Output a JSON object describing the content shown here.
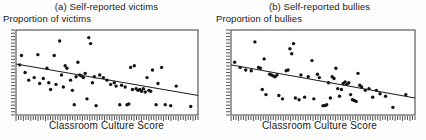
{
  "figure": {
    "kind": "two-panel-scatterplot",
    "background_color": "#fdfdfd",
    "ink_color": "#1a1a1a"
  },
  "panels": [
    {
      "title": "(a) Self-reported victims",
      "ylabel": "Proportion of victims",
      "xlabel": "Classroom Culture Score"
    },
    {
      "title": "(b) Self-reported bullies",
      "ylabel": "Proportion of bullies",
      "xlabel": "Classroom Culture Score"
    }
  ],
  "chart_data": [
    {
      "type": "scatter",
      "title": "(a) Self-reported victims",
      "xlabel": "Classroom Culture Score",
      "ylabel": "Proportion of victims",
      "xlim": [
        0,
        1
      ],
      "ylim": [
        0,
        1
      ],
      "grid": false,
      "legend": "none",
      "axis_ticks": "rug-style dense tick marks on bottom and left axes; no numeric tick labels",
      "trendline": {
        "type": "linear-fit",
        "description": "negative slope regression line",
        "x_start": 0.0,
        "y_start": 0.6,
        "x_end": 1.0,
        "y_end": 0.23
      },
      "points": [
        [
          0.02,
          0.59
        ],
        [
          0.03,
          0.7
        ],
        [
          0.05,
          0.5
        ],
        [
          0.07,
          0.41
        ],
        [
          0.1,
          0.44
        ],
        [
          0.12,
          0.71
        ],
        [
          0.13,
          0.37
        ],
        [
          0.15,
          0.43
        ],
        [
          0.17,
          0.55
        ],
        [
          0.18,
          0.38
        ],
        [
          0.19,
          0.3
        ],
        [
          0.21,
          0.7
        ],
        [
          0.22,
          0.36
        ],
        [
          0.24,
          0.87
        ],
        [
          0.25,
          0.47
        ],
        [
          0.26,
          0.33
        ],
        [
          0.27,
          0.58
        ],
        [
          0.28,
          0.55
        ],
        [
          0.3,
          0.41
        ],
        [
          0.31,
          0.29
        ],
        [
          0.32,
          0.12
        ],
        [
          0.33,
          0.45
        ],
        [
          0.34,
          0.62
        ],
        [
          0.35,
          0.47
        ],
        [
          0.36,
          0.46
        ],
        [
          0.37,
          0.44
        ],
        [
          0.38,
          0.49
        ],
        [
          0.39,
          0.19
        ],
        [
          0.4,
          0.91
        ],
        [
          0.41,
          0.84
        ],
        [
          0.42,
          0.38
        ],
        [
          0.43,
          0.45
        ],
        [
          0.44,
          0.11
        ],
        [
          0.46,
          0.47
        ],
        [
          0.48,
          0.44
        ],
        [
          0.5,
          0.41
        ],
        [
          0.52,
          0.36
        ],
        [
          0.54,
          0.38
        ],
        [
          0.55,
          0.34
        ],
        [
          0.57,
          0.12
        ],
        [
          0.58,
          0.35
        ],
        [
          0.6,
          0.33
        ],
        [
          0.61,
          0.12
        ],
        [
          0.62,
          0.13
        ],
        [
          0.63,
          0.56
        ],
        [
          0.64,
          0.3
        ],
        [
          0.65,
          0.58
        ],
        [
          0.66,
          0.31
        ],
        [
          0.67,
          0.29
        ],
        [
          0.68,
          0.3
        ],
        [
          0.69,
          0.28
        ],
        [
          0.7,
          0.31
        ],
        [
          0.71,
          0.27
        ],
        [
          0.72,
          0.44
        ],
        [
          0.73,
          0.29
        ],
        [
          0.74,
          0.28
        ],
        [
          0.75,
          0.53
        ],
        [
          0.77,
          0.12
        ],
        [
          0.78,
          0.37
        ],
        [
          0.8,
          0.56
        ],
        [
          0.82,
          0.12
        ],
        [
          0.85,
          0.11
        ],
        [
          0.88,
          0.34
        ],
        [
          0.96,
          0.1
        ]
      ]
    },
    {
      "type": "scatter",
      "title": "(b) Self-reported bullies",
      "xlabel": "Classroom Culture Score",
      "ylabel": "Proportion of bullies",
      "xlim": [
        0,
        1
      ],
      "ylim": [
        0,
        1
      ],
      "grid": false,
      "legend": "none",
      "axis_ticks": "rug-style dense tick marks on bottom and left axes; no numeric tick labels",
      "trendline": {
        "type": "linear-fit",
        "description": "negative slope regression line",
        "x_start": 0.0,
        "y_start": 0.59,
        "x_end": 1.0,
        "y_end": 0.2
      },
      "points": [
        [
          0.02,
          0.62
        ],
        [
          0.05,
          0.56
        ],
        [
          0.08,
          0.53
        ],
        [
          0.11,
          0.52
        ],
        [
          0.13,
          0.86
        ],
        [
          0.15,
          0.56
        ],
        [
          0.16,
          0.55
        ],
        [
          0.17,
          0.3
        ],
        [
          0.18,
          0.66
        ],
        [
          0.19,
          0.24
        ],
        [
          0.21,
          0.48
        ],
        [
          0.22,
          0.47
        ],
        [
          0.23,
          0.46
        ],
        [
          0.24,
          0.45
        ],
        [
          0.25,
          0.47
        ],
        [
          0.26,
          0.23
        ],
        [
          0.28,
          0.19
        ],
        [
          0.3,
          0.52
        ],
        [
          0.31,
          0.53
        ],
        [
          0.32,
          0.78
        ],
        [
          0.33,
          0.72
        ],
        [
          0.34,
          0.84
        ],
        [
          0.35,
          0.2
        ],
        [
          0.37,
          0.18
        ],
        [
          0.38,
          0.47
        ],
        [
          0.4,
          0.21
        ],
        [
          0.42,
          0.45
        ],
        [
          0.44,
          0.64
        ],
        [
          0.45,
          0.19
        ],
        [
          0.47,
          0.48
        ],
        [
          0.48,
          0.44
        ],
        [
          0.5,
          0.11
        ],
        [
          0.51,
          0.11
        ],
        [
          0.52,
          0.12
        ],
        [
          0.53,
          0.38
        ],
        [
          0.54,
          0.2
        ],
        [
          0.55,
          0.45
        ],
        [
          0.56,
          0.43
        ],
        [
          0.57,
          0.55
        ],
        [
          0.58,
          0.31
        ],
        [
          0.59,
          0.22
        ],
        [
          0.6,
          0.3
        ],
        [
          0.61,
          0.37
        ],
        [
          0.62,
          0.39
        ],
        [
          0.63,
          0.36
        ],
        [
          0.64,
          0.38
        ],
        [
          0.65,
          0.24
        ],
        [
          0.66,
          0.18
        ],
        [
          0.67,
          0.17
        ],
        [
          0.68,
          0.16
        ],
        [
          0.69,
          0.49
        ],
        [
          0.7,
          0.35
        ],
        [
          0.71,
          0.33
        ],
        [
          0.73,
          0.29
        ],
        [
          0.75,
          0.31
        ],
        [
          0.77,
          0.21
        ],
        [
          0.79,
          0.29
        ],
        [
          0.81,
          0.25
        ],
        [
          0.84,
          0.22
        ],
        [
          0.88,
          0.09
        ],
        [
          0.95,
          0.24
        ]
      ]
    }
  ]
}
